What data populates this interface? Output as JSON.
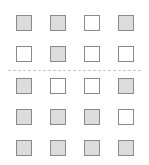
{
  "grid": {
    "columns": [
      16,
      50,
      84,
      118
    ],
    "rows": [
      15,
      46,
      78,
      109,
      140
    ],
    "cells": [
      [
        true,
        true,
        false,
        true
      ],
      [
        false,
        true,
        false,
        false
      ],
      [
        true,
        false,
        false,
        true
      ],
      [
        true,
        true,
        true,
        false
      ],
      [
        true,
        true,
        true,
        true
      ]
    ],
    "divider_after_row": 2
  },
  "colors": {
    "filled": "#dcdcdc",
    "empty": "#ffffff",
    "border": "#8a8a8a"
  }
}
